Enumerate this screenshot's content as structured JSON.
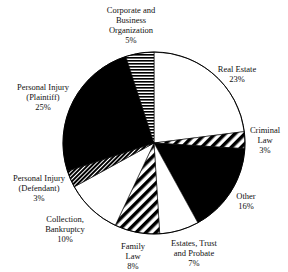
{
  "chart_data": {
    "type": "pie",
    "title": "",
    "center": [
      154,
      143
    ],
    "radius": 91,
    "start_angle_deg": 0,
    "direction": "clockwise",
    "slices": [
      {
        "label": "Real Estate",
        "value": 23,
        "fill": "white",
        "lines": [
          "Real Estate",
          "23%"
        ],
        "lx": 237,
        "ly": 64
      },
      {
        "label": "Criminal Law",
        "value": 3,
        "fill": "diag",
        "lines": [
          "Criminal",
          "Law",
          "3%"
        ],
        "lx": 265,
        "ly": 125
      },
      {
        "label": "Other",
        "value": 16,
        "fill": "black",
        "lines": [
          "Other",
          "16%"
        ],
        "lx": 246,
        "ly": 191
      },
      {
        "label": "Estates, Trust and Probate",
        "value": 7,
        "fill": "white",
        "lines": [
          "Estates, Trust",
          "and Probate",
          "7%"
        ],
        "lx": 194,
        "ly": 238
      },
      {
        "label": "Family Law",
        "value": 8,
        "fill": "diag",
        "lines": [
          "Family",
          "Law",
          "8%"
        ],
        "lx": 133,
        "ly": 241
      },
      {
        "label": "Collection, Bankruptcy",
        "value": 10,
        "fill": "white",
        "lines": [
          "Collection,",
          "Bankruptcy",
          "10%"
        ],
        "lx": 65,
        "ly": 214
      },
      {
        "label": "Personal Injury (Defendant)",
        "value": 3,
        "fill": "finediag",
        "lines": [
          "Personal Injury",
          "(Defendant)",
          "3%"
        ],
        "lx": 39,
        "ly": 173
      },
      {
        "label": "Personal Injury (Plaintiff)",
        "value": 25,
        "fill": "black",
        "lines": [
          "Personal Injury",
          "(Plaintiff)",
          "25%"
        ],
        "lx": 43,
        "ly": 82
      },
      {
        "label": "Corporate and Business Organization",
        "value": 5,
        "fill": "hstripe",
        "lines": [
          "Corporate and",
          "Business",
          "Organization",
          "5%"
        ],
        "lx": 131,
        "ly": 5
      }
    ]
  }
}
